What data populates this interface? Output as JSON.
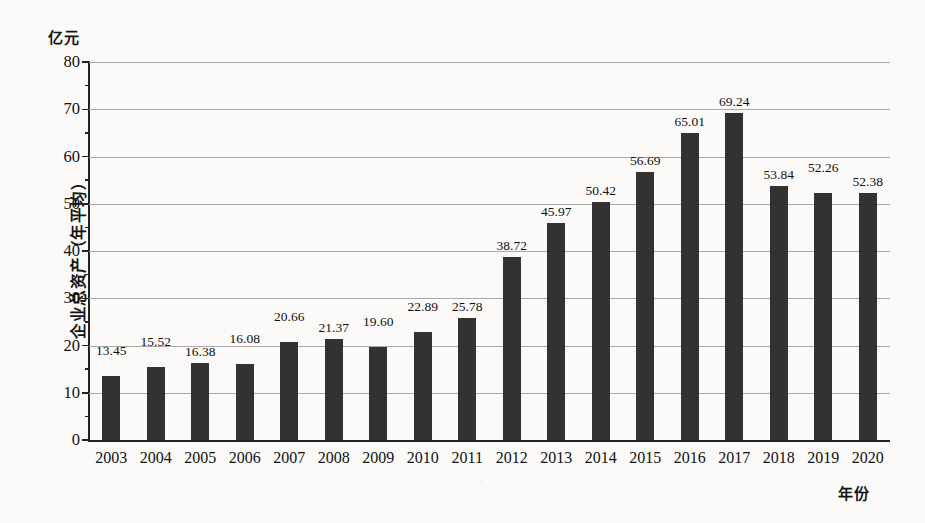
{
  "chart_data": {
    "type": "bar",
    "title": "",
    "xlabel": "年份",
    "ylabel": "企业总资产（年平均）",
    "y_unit": "亿元",
    "ylim": [
      0,
      80
    ],
    "ytick_step": 10,
    "yminor_step": 5,
    "grid": "horizontal-major",
    "legend": "none",
    "bar_color": "#333131",
    "gridline_color": "#a8a8a8",
    "axis_color": "#232323",
    "background_color": "#fbfaf8",
    "categories": [
      "2003",
      "2004",
      "2005",
      "2006",
      "2007",
      "2008",
      "2009",
      "2010",
      "2011",
      "2012",
      "2013",
      "2014",
      "2015",
      "2016",
      "2017",
      "2018",
      "2019",
      "2020"
    ],
    "values": [
      13.45,
      15.52,
      16.38,
      16.08,
      20.66,
      21.37,
      19.6,
      22.89,
      25.78,
      38.72,
      45.97,
      50.42,
      56.69,
      65.01,
      69.24,
      53.84,
      52.26,
      52.38
    ],
    "value_labels": [
      "13.45",
      "15.52",
      "16.38",
      "16.08",
      "20.66",
      "21.37",
      "19.60",
      "22.89",
      "25.78",
      "38.72",
      "45.97",
      "50.42",
      "56.69",
      "65.01",
      "69.24",
      "53.84",
      "52.26",
      "52.38"
    ],
    "ytick_labels": [
      "0",
      "10",
      "20",
      "30",
      "40",
      "50",
      "60",
      "70",
      "80"
    ],
    "ytick_values": [
      0,
      10,
      20,
      30,
      40,
      50,
      60,
      70,
      80
    ]
  }
}
